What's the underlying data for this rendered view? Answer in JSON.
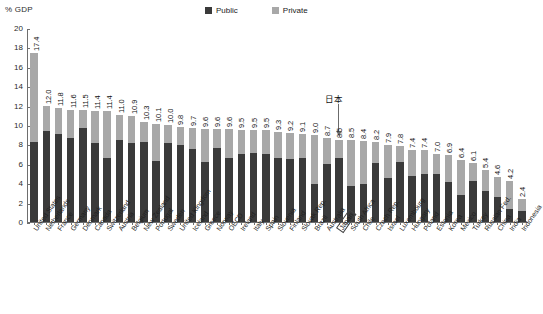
{
  "axis_title": "% GDP",
  "legend": {
    "items": [
      {
        "label": "Public",
        "color": "#3a3a3a",
        "icon": "square-swatch-icon"
      },
      {
        "label": "Private",
        "color": "#a8a8a8",
        "icon": "square-swatch-icon"
      }
    ]
  },
  "annotation": {
    "text": "日本",
    "target": "Japan",
    "icon": "down-arrow-icon"
  },
  "chart_data": {
    "type": "bar",
    "title": "",
    "subtitle": "",
    "xlabel": "",
    "ylabel": "% GDP",
    "ylim": [
      0,
      20
    ],
    "yticks": [
      0,
      2,
      4,
      6,
      8,
      10,
      12,
      14,
      16,
      18,
      20
    ],
    "grid": false,
    "stacked": true,
    "legend_position": "top-right",
    "highlight": "Japan",
    "categories": [
      "United States",
      "Netherlands",
      "France",
      "Germany",
      "Denmark",
      "Canada",
      "Switzerland",
      "Austria",
      "Belgium",
      "New Zealand",
      "Portugal",
      "Sweden",
      "United Kingdom",
      "Iceland",
      "Greece",
      "Norway",
      "OECD",
      "Ireland",
      "Italy",
      "Spain",
      "Slovenia",
      "Finland",
      "Slovak Rep.",
      "Brazil",
      "Australia",
      "Japan",
      "South Africa",
      "Chile",
      "Czech Rep.",
      "Israel",
      "Luxembourg",
      "Hungary",
      "Poland",
      "Estonia",
      "Korea",
      "Mexico",
      "Turkey",
      "Russian Fed.",
      "China",
      "India",
      "Indonesia"
    ],
    "totals": [
      17.4,
      12.0,
      11.8,
      11.6,
      11.5,
      11.4,
      11.4,
      11.0,
      10.9,
      10.3,
      10.1,
      10.0,
      9.8,
      9.7,
      9.6,
      9.6,
      9.6,
      9.5,
      9.5,
      9.5,
      9.3,
      9.2,
      9.1,
      9.0,
      8.7,
      8.5,
      8.5,
      8.4,
      8.2,
      7.9,
      7.8,
      7.4,
      7.4,
      7.0,
      6.9,
      6.4,
      6.1,
      5.4,
      4.6,
      4.2,
      2.4
    ],
    "series": [
      {
        "name": "Public",
        "color": "#3a3a3a",
        "values": [
          8.3,
          9.4,
          9.1,
          8.7,
          9.7,
          8.1,
          6.6,
          8.5,
          8.1,
          8.2,
          6.3,
          8.1,
          7.9,
          7.5,
          6.2,
          7.6,
          6.6,
          7.0,
          7.1,
          7.0,
          6.6,
          6.5,
          6.6,
          3.9,
          6.0,
          6.6,
          3.7,
          3.9,
          6.1,
          4.5,
          6.2,
          4.7,
          4.9,
          5.0,
          4.1,
          2.8,
          4.2,
          3.2,
          2.6,
          1.3,
          1.1
        ]
      },
      {
        "name": "Private",
        "color": "#a8a8a8",
        "values": [
          9.1,
          2.6,
          2.7,
          2.9,
          1.8,
          3.3,
          4.8,
          2.5,
          2.8,
          2.1,
          3.8,
          1.9,
          1.9,
          2.2,
          3.4,
          2.0,
          3.0,
          2.5,
          2.4,
          2.5,
          2.7,
          2.7,
          2.5,
          5.1,
          2.7,
          1.9,
          4.8,
          4.5,
          2.1,
          3.4,
          1.6,
          2.7,
          2.5,
          2.0,
          2.8,
          3.6,
          1.9,
          2.2,
          2.0,
          2.9,
          1.3
        ]
      }
    ]
  }
}
